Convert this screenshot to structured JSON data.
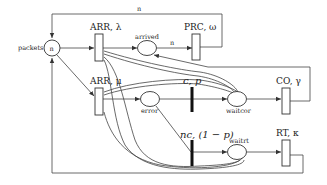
{
  "diagram": {
    "type": "petri-net",
    "places": {
      "packets": {
        "label": "packets",
        "token": "n"
      },
      "arrived": {
        "label": "arrived"
      },
      "error": {
        "label": "error"
      },
      "waitcor": {
        "label": "waitcor"
      },
      "waitrt": {
        "label": "waitrt"
      }
    },
    "transitions": {
      "arr_lambda": {
        "label": "ARR, λ"
      },
      "arr_mu": {
        "label": "ARR, μ"
      },
      "prc_omega": {
        "label": "PRC, ω"
      },
      "c_p": {
        "label": "c, p"
      },
      "nc_1mp": {
        "label": "nc, (1 − p)"
      },
      "co_gamma": {
        "label": "CO, γ"
      },
      "rt_kappa": {
        "label": "RT, κ"
      }
    },
    "arc_labels": {
      "top_loop": "n",
      "arrived_to_prc": "n"
    },
    "colors": {
      "stroke": "#333333",
      "background": "#ffffff"
    }
  }
}
